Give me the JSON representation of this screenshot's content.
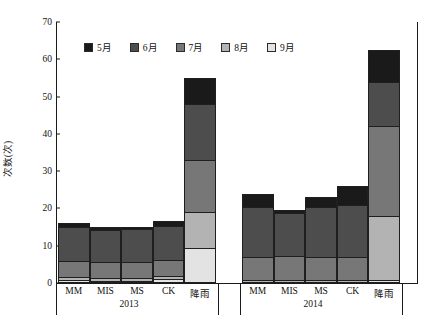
{
  "chart_data": {
    "type": "bar",
    "stacked": true,
    "title": "",
    "xlabel": "",
    "ylabel": "次数(次)",
    "ylim": [
      0,
      70
    ],
    "yticks": [
      0,
      10,
      20,
      30,
      40,
      50,
      60,
      70
    ],
    "grid": false,
    "legend_position": "top-center",
    "legend": [
      "5月",
      "6月",
      "7月",
      "8月",
      "9月"
    ],
    "series_colors": [
      "#1a1a1a",
      "#4d4d4d",
      "#777777",
      "#b3b3b3",
      "#e3e3e3"
    ],
    "groups": [
      {
        "name": "2013",
        "categories": [
          "MM",
          "MIS",
          "MS",
          "CK",
          "降雨"
        ]
      },
      {
        "name": "2014",
        "categories": [
          "MM",
          "MIS",
          "MS",
          "CK",
          "降雨"
        ]
      }
    ],
    "series": [
      {
        "name": "5月",
        "color": "#1a1a1a",
        "values_2013": [
          1.0,
          0.7,
          0.4,
          1.2,
          7.0
        ],
        "values_2014": [
          3.5,
          0.7,
          2.5,
          5.0,
          8.5
        ]
      },
      {
        "name": "6月",
        "color": "#4d4d4d",
        "values_2013": [
          9.0,
          8.6,
          8.9,
          9.0,
          15.0
        ],
        "values_2014": [
          13.5,
          11.5,
          13.5,
          14.0,
          12.0
        ]
      },
      {
        "name": "7月",
        "color": "#777777",
        "values_2013": [
          4.3,
          4.3,
          4.3,
          4.3,
          14.0
        ],
        "values_2014": [
          6.2,
          6.6,
          6.2,
          6.2,
          24.0
        ]
      },
      {
        "name": "8月",
        "color": "#b3b3b3",
        "values_2013": [
          0.8,
          0.8,
          0.8,
          0.8,
          9.5
        ],
        "values_2014": [
          0.8,
          0.7,
          0.8,
          0.8,
          17.2
        ]
      },
      {
        "name": "9月",
        "color": "#e3e3e3",
        "values_2013": [
          0.9,
          0.6,
          0.6,
          1.2,
          9.5
        ],
        "values_2014": [
          0.0,
          0.0,
          0.0,
          0.0,
          0.8
        ]
      }
    ],
    "totals": {
      "2013": [
        16.0,
        15.0,
        15.0,
        16.5,
        55.0
      ],
      "2014": [
        24.0,
        19.5,
        23.0,
        26.0,
        62.5
      ]
    }
  }
}
